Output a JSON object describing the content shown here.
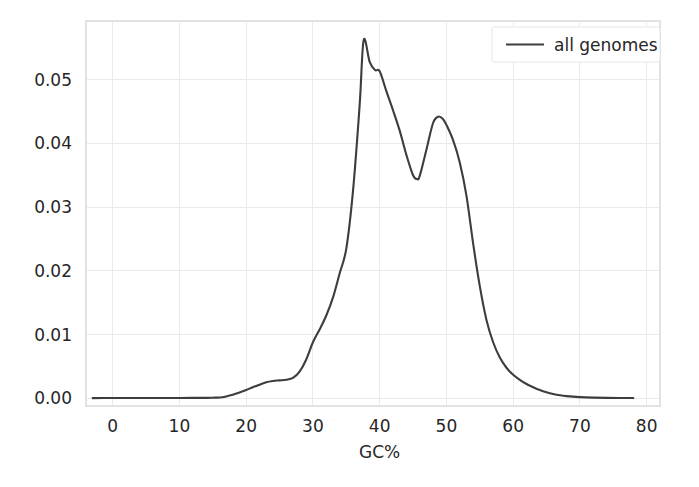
{
  "chart_data": {
    "type": "line",
    "title": "",
    "subtitle": "",
    "xlabel": "GC%",
    "ylabel": "",
    "xlim": [
      -4,
      82
    ],
    "ylim": [
      -0.0012,
      0.0592
    ],
    "grid": true,
    "legend_position": "top-right",
    "line_color": "#3d3d3d",
    "grid_color": "#eaeaea",
    "background_color": "#ffffff",
    "xticks": [
      0,
      10,
      20,
      30,
      40,
      50,
      60,
      70,
      80
    ],
    "xtick_labels": [
      "0",
      "10",
      "20",
      "30",
      "40",
      "50",
      "60",
      "70",
      "80"
    ],
    "yticks": [
      0.0,
      0.01,
      0.02,
      0.03,
      0.04,
      0.05
    ],
    "ytick_labels": [
      "0.00",
      "0.01",
      "0.02",
      "0.03",
      "0.04",
      "0.05"
    ],
    "series": [
      {
        "name": "all genomes",
        "x": [
          -3,
          0,
          2,
          4,
          6,
          8,
          10,
          12,
          14,
          15,
          16,
          17,
          18,
          19,
          20,
          21,
          22,
          23,
          24,
          25,
          26,
          27,
          28,
          29,
          30,
          31,
          32,
          33,
          34,
          35,
          36,
          37,
          37.6,
          38.5,
          39.3,
          40,
          41,
          42,
          43,
          44,
          45,
          45.6,
          46,
          47,
          48,
          48.8,
          49.5,
          50,
          51,
          52,
          53,
          54,
          55,
          56,
          57,
          58,
          59,
          60,
          61,
          62,
          63,
          64,
          65,
          66,
          67,
          68,
          70,
          72,
          74,
          76,
          78
        ],
        "y": [
          4e-05,
          5e-05,
          5e-05,
          5e-05,
          5e-05,
          5e-05,
          6e-05,
          7e-05,
          8e-05,
          0.0001,
          0.00014,
          0.0003,
          0.00055,
          0.0009,
          0.0013,
          0.00175,
          0.00215,
          0.00252,
          0.00272,
          0.00282,
          0.00292,
          0.0032,
          0.0042,
          0.0061,
          0.0088,
          0.0108,
          0.013,
          0.0158,
          0.0196,
          0.0235,
          0.0325,
          0.046,
          0.0562,
          0.0528,
          0.0515,
          0.0513,
          0.0482,
          0.0452,
          0.042,
          0.0382,
          0.035,
          0.0344,
          0.0349,
          0.039,
          0.0432,
          0.0442,
          0.0438,
          0.0429,
          0.0405,
          0.037,
          0.0318,
          0.0243,
          0.0176,
          0.0123,
          0.0088,
          0.0064,
          0.0048,
          0.0037,
          0.0029,
          0.00225,
          0.00175,
          0.0013,
          0.00095,
          0.00068,
          0.00048,
          0.00035,
          0.0002,
          0.00012,
          8e-05,
          6e-05,
          5e-05
        ]
      }
    ]
  },
  "legend": {
    "entries": [
      {
        "label": "all genomes",
        "color": "#3d3d3d"
      }
    ]
  },
  "axes": {
    "x_axis_title": "GC%",
    "y_axis_title": ""
  }
}
